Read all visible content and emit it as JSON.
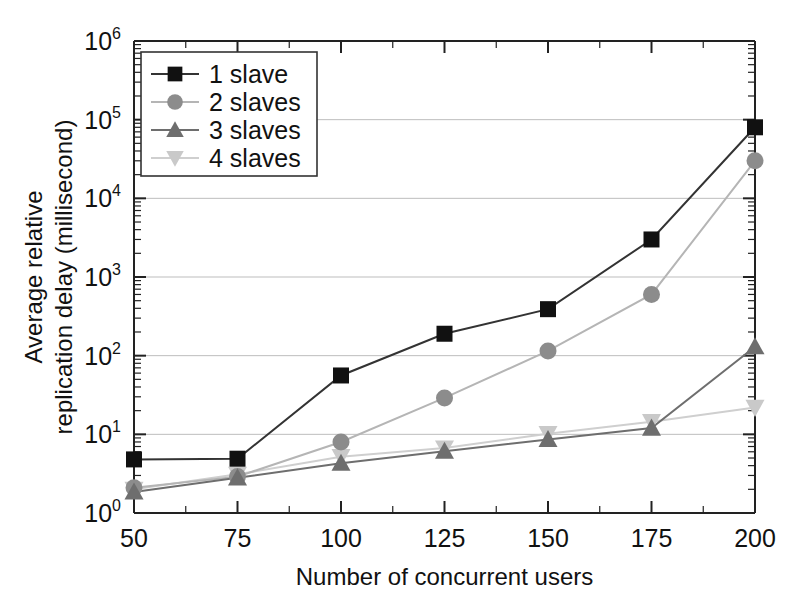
{
  "chart_data": {
    "type": "line",
    "title": "",
    "xlabel": "Number of concurrent users",
    "ylabel_line1": "Average relative",
    "ylabel_line2": "replication delay (millisecond)",
    "x": [
      50,
      75,
      100,
      125,
      150,
      175,
      200
    ],
    "xtick_labels": [
      "50",
      "75",
      "100",
      "125",
      "150",
      "175",
      "200"
    ],
    "xlim": [
      50,
      200
    ],
    "ylim": [
      1,
      1000000
    ],
    "yscale": "log",
    "ytick_labels": [
      "10",
      "10",
      "10",
      "10",
      "10",
      "10",
      "10"
    ],
    "ytick_exponents": [
      "0",
      "1",
      "2",
      "3",
      "4",
      "5",
      "6"
    ],
    "ytick_values": [
      1,
      10,
      100,
      1000,
      10000,
      100000,
      1000000
    ],
    "grid": "horizontal",
    "legend_position": "top-left",
    "series": [
      {
        "name": "1 slave",
        "marker": "square",
        "color": "#111111",
        "line_color": "#333333",
        "values": [
          4.8,
          4.9,
          56,
          190,
          390,
          3000,
          80000
        ]
      },
      {
        "name": "2 slaves",
        "marker": "circle",
        "color": "#8c8c8c",
        "line_color": "#b5b5b5",
        "values": [
          2.1,
          2.9,
          8.0,
          29,
          115,
          600,
          30000
        ]
      },
      {
        "name": "3 slaves",
        "marker": "triangle-up",
        "color": "#6e6e6e",
        "line_color": "#6e6e6e",
        "values": [
          1.85,
          2.8,
          4.3,
          6.1,
          8.6,
          12.0,
          130
        ]
      },
      {
        "name": "4 slaves",
        "marker": "triangle-down",
        "color": "#c9c9c9",
        "line_color": "#cfcfcf",
        "values": [
          2.0,
          3.1,
          5.2,
          6.7,
          10.2,
          14.5,
          22
        ]
      }
    ]
  }
}
